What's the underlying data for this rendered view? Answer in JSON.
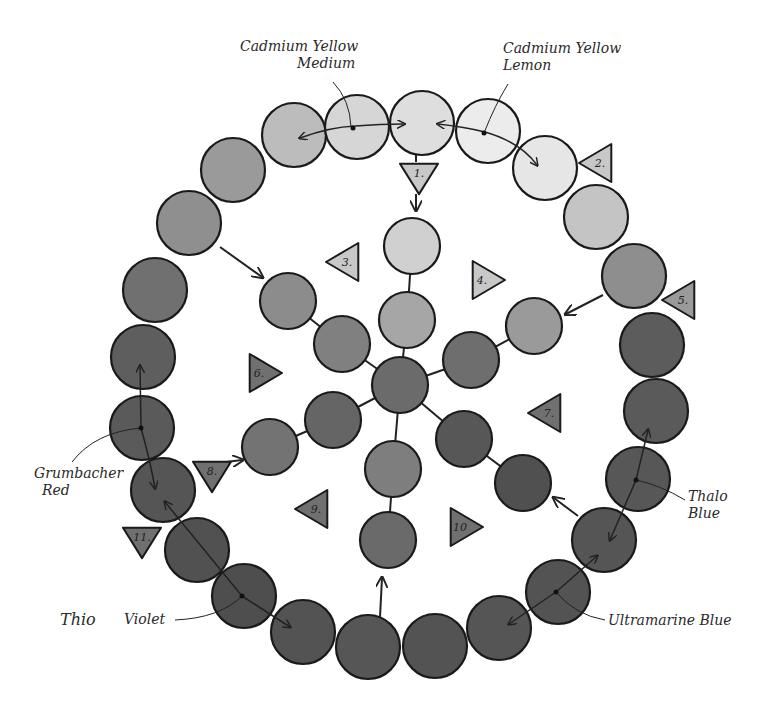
{
  "diagram": {
    "type": "watercolor color wheel (grayscale)",
    "labels": {
      "cad_yellow_medium": [
        "Cadmium Yellow",
        "Medium"
      ],
      "cad_yellow_lemon": [
        "Cadmium Yellow",
        "Lemon"
      ],
      "grumbacher_red": [
        "Grumbacher",
        "Red"
      ],
      "thalo_blue": [
        "Thalo",
        "Blue"
      ],
      "ultramarine_blue": "Ultramarine Blue",
      "thio": "Thio",
      "violet": "Violet"
    },
    "triangles": [
      {
        "num": "1.",
        "x": 419,
        "y": 177,
        "dir": "down"
      },
      {
        "num": "2.",
        "x": 598,
        "y": 163,
        "dir": "left"
      },
      {
        "num": "3.",
        "x": 345,
        "y": 262,
        "dir": "left"
      },
      {
        "num": "4.",
        "x": 486,
        "y": 280,
        "dir": "right"
      },
      {
        "num": "5.",
        "x": 681,
        "y": 300,
        "dir": "left"
      },
      {
        "num": "6.",
        "x": 263,
        "y": 373,
        "dir": "right"
      },
      {
        "num": "7.",
        "x": 547,
        "y": 413,
        "dir": "left"
      },
      {
        "num": "8.",
        "x": 212,
        "y": 475,
        "dir": "down"
      },
      {
        "num": "9.",
        "x": 314,
        "y": 509,
        "dir": "left"
      },
      {
        "num": "10",
        "x": 464,
        "y": 527,
        "dir": "right"
      },
      {
        "num": "11.",
        "x": 142,
        "y": 541,
        "dir": "down"
      }
    ],
    "outer_ring": [
      {
        "x": 422,
        "y": 123,
        "fill": "#dedede"
      },
      {
        "x": 488,
        "y": 131,
        "fill": "#ececec"
      },
      {
        "x": 545,
        "y": 168,
        "fill": "#e6e6e6"
      },
      {
        "x": 596,
        "y": 217,
        "fill": "#c4c4c4"
      },
      {
        "x": 634,
        "y": 276,
        "fill": "#8e8e8e"
      },
      {
        "x": 652,
        "y": 345,
        "fill": "#5c5c5c"
      },
      {
        "x": 656,
        "y": 411,
        "fill": "#5a5a5a"
      },
      {
        "x": 638,
        "y": 479,
        "fill": "#575757"
      },
      {
        "x": 604,
        "y": 540,
        "fill": "#555555"
      },
      {
        "x": 558,
        "y": 592,
        "fill": "#535353"
      },
      {
        "x": 499,
        "y": 628,
        "fill": "#555555"
      },
      {
        "x": 435,
        "y": 646,
        "fill": "#535353"
      },
      {
        "x": 368,
        "y": 647,
        "fill": "#565656"
      },
      {
        "x": 303,
        "y": 632,
        "fill": "#535353"
      },
      {
        "x": 244,
        "y": 596,
        "fill": "#4e4e4e"
      },
      {
        "x": 197,
        "y": 550,
        "fill": "#515151"
      },
      {
        "x": 163,
        "y": 490,
        "fill": "#555555"
      },
      {
        "x": 142,
        "y": 428,
        "fill": "#5a5a5a"
      },
      {
        "x": 143,
        "y": 357,
        "fill": "#5e5e5e"
      },
      {
        "x": 155,
        "y": 290,
        "fill": "#707070"
      },
      {
        "x": 189,
        "y": 223,
        "fill": "#8f8f8f"
      },
      {
        "x": 233,
        "y": 170,
        "fill": "#9a9a9a"
      },
      {
        "x": 294,
        "y": 135,
        "fill": "#bcbcbc"
      },
      {
        "x": 357,
        "y": 127,
        "fill": "#d6d6d6"
      }
    ],
    "inner_circles": [
      {
        "x": 412,
        "y": 246,
        "fill": "#d0d0d0"
      },
      {
        "x": 407,
        "y": 320,
        "fill": "#a6a6a6"
      },
      {
        "x": 400,
        "y": 385,
        "fill": "#6b6b6b"
      },
      {
        "x": 288,
        "y": 301,
        "fill": "#8c8c8c"
      },
      {
        "x": 342,
        "y": 344,
        "fill": "#808080"
      },
      {
        "x": 534,
        "y": 326,
        "fill": "#9a9a9a"
      },
      {
        "x": 471,
        "y": 360,
        "fill": "#6e6e6e"
      },
      {
        "x": 270,
        "y": 447,
        "fill": "#737373"
      },
      {
        "x": 333,
        "y": 420,
        "fill": "#656565"
      },
      {
        "x": 464,
        "y": 439,
        "fill": "#575757"
      },
      {
        "x": 523,
        "y": 483,
        "fill": "#505050"
      },
      {
        "x": 393,
        "y": 469,
        "fill": "#7e7e7e"
      },
      {
        "x": 388,
        "y": 540,
        "fill": "#6a6a6a"
      }
    ]
  }
}
